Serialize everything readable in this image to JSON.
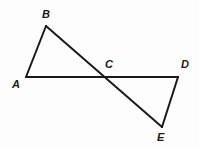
{
  "figure": {
    "canvas": {
      "width": 199,
      "height": 149
    },
    "background_color": "#fdfdfd",
    "stroke_color": "#1a1a1a",
    "stroke_width": 2,
    "label_color": "#1a1a1a",
    "points": {
      "A": {
        "label": "A",
        "x": 26,
        "y": 77,
        "label_x": 12,
        "label_y": 79
      },
      "B": {
        "label": "B",
        "x": 46,
        "y": 26,
        "label_x": 42,
        "label_y": 9
      },
      "C": {
        "label": "C",
        "x": 106,
        "y": 77,
        "label_x": 105,
        "label_y": 59
      },
      "D": {
        "label": "D",
        "x": 178,
        "y": 77,
        "label_x": 181,
        "label_y": 59
      },
      "E": {
        "label": "E",
        "x": 162,
        "y": 127,
        "label_x": 157,
        "label_y": 132
      }
    },
    "segments": [
      {
        "name": "segment-AB",
        "from": "A",
        "to": "B"
      },
      {
        "name": "segment-AD",
        "from": "A",
        "to": "D"
      },
      {
        "name": "segment-BE",
        "from": "B",
        "to": "E"
      },
      {
        "name": "segment-DE",
        "from": "D",
        "to": "E"
      }
    ]
  }
}
